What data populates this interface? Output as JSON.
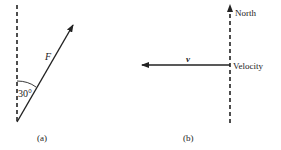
{
  "figure_a": {
    "force_label": "F",
    "angle_label": "30°",
    "caption": "(a)"
  },
  "figure_b": {
    "north_label": "North",
    "velocity_label": "Velocity",
    "vector_label": "v",
    "caption": "(b)"
  },
  "colors": {
    "ink": "#222222",
    "background": "#ffffff"
  }
}
